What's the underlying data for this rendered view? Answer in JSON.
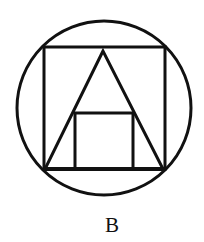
{
  "figure": {
    "label": "B",
    "stroke_color": "#111111",
    "background": "#ffffff"
  },
  "shapes": {
    "circle": {
      "cx": 104,
      "cy": 108,
      "r": 87,
      "stroke_width": 3
    },
    "outer_square": {
      "x": 44,
      "y": 47,
      "width": 121,
      "height": 122,
      "stroke_width": 3
    },
    "triangle": {
      "points": "103,51 45,169 163,169",
      "stroke_width": 3
    },
    "inner_square": {
      "x": 75,
      "y": 113,
      "width": 58,
      "height": 56,
      "stroke_width": 3
    },
    "base_line": {
      "x1": 44,
      "y1": 169,
      "x2": 165,
      "y2": 169,
      "stroke_width": 4
    }
  }
}
